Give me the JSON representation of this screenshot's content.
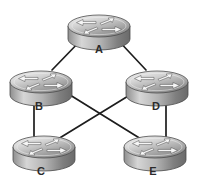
{
  "diagram": {
    "type": "network-topology",
    "background_color": "#ffffff",
    "width": 198,
    "height": 188,
    "device_type": "router",
    "device_icon": "router-icon",
    "link_color": "#1d1d1d",
    "label_color": "#2b2b2b",
    "nodes": [
      {
        "id": "A",
        "label": "A",
        "cx": 99,
        "cy": 26,
        "label_x": 99,
        "label_y": 50,
        "name": "router-a"
      },
      {
        "id": "B",
        "label": "B",
        "cx": 41,
        "cy": 82,
        "label_x": 39,
        "label_y": 107,
        "name": "router-b"
      },
      {
        "id": "D",
        "label": "D",
        "cx": 157,
        "cy": 82,
        "label_x": 156,
        "label_y": 107,
        "name": "router-d"
      },
      {
        "id": "C",
        "label": "C",
        "cx": 44,
        "cy": 147,
        "label_x": 41,
        "label_y": 172,
        "name": "router-c"
      },
      {
        "id": "E",
        "label": "E",
        "cx": 155,
        "cy": 147,
        "label_x": 153,
        "label_y": 172,
        "name": "router-e"
      }
    ],
    "links": [
      {
        "from": "A",
        "to": "B",
        "name": "link-a-b",
        "x1": 83,
        "y1": 38,
        "x2": 52,
        "y2": 70
      },
      {
        "from": "A",
        "to": "D",
        "name": "link-a-d",
        "x1": 116,
        "y1": 38,
        "x2": 146,
        "y2": 70
      },
      {
        "from": "B",
        "to": "C",
        "name": "link-b-c",
        "x1": 34,
        "y1": 93,
        "x2": 34,
        "y2": 139
      },
      {
        "from": "D",
        "to": "E",
        "name": "link-d-e",
        "x1": 166,
        "y1": 93,
        "x2": 166,
        "y2": 139
      },
      {
        "from": "B",
        "to": "E",
        "name": "link-b-e",
        "x1": 62,
        "y1": 90,
        "x2": 141,
        "y2": 139
      },
      {
        "from": "D",
        "to": "C",
        "name": "link-d-c",
        "x1": 138,
        "y1": 90,
        "x2": 58,
        "y2": 139
      }
    ],
    "icon_geometry": {
      "rx": 31,
      "ry": 11,
      "body_height": 13,
      "top_light": "#efefef",
      "top_mid": "#c2c2c2",
      "top_dark": "#8d8d8d",
      "side_light": "#d8d8d8",
      "side_dark": "#6a6a6a",
      "outline": "#4a4a4a",
      "arrow_fill": "#f4f4f4",
      "arrow_stroke": "#555555"
    }
  }
}
